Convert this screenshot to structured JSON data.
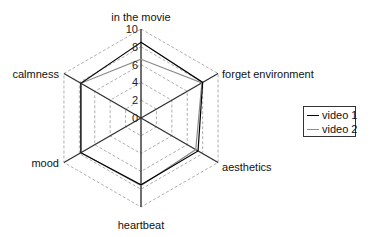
{
  "chart_data": {
    "type": "radar",
    "title": "",
    "axes": [
      "in the movie",
      "forget environment",
      "aesthetics",
      "heartbeat",
      "mood",
      "calmness"
    ],
    "range": [
      0,
      10
    ],
    "ticks": [
      0,
      2,
      4,
      6,
      8,
      10
    ],
    "grid": "dashed hexagons",
    "legend_position": "right",
    "series": [
      {
        "name": "video 1",
        "color": "#000000",
        "values": [
          8.5,
          8.0,
          7.4,
          7.5,
          7.8,
          7.8
        ]
      },
      {
        "name": "video 2",
        "color": "#8c8c8c",
        "values": [
          6.6,
          7.9,
          7.1,
          7.6,
          7.8,
          7.8
        ]
      }
    ]
  },
  "legend": {
    "items": [
      {
        "label": "video 1",
        "color": "#000000"
      },
      {
        "label": "video 2",
        "color": "#8c8c8c"
      }
    ]
  }
}
